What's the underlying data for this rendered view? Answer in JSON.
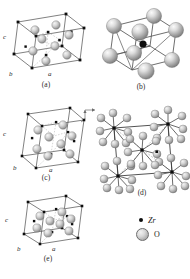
{
  "figure": {
    "type": "crystal-structure-diagram",
    "background": "#ffffff"
  },
  "panels": [
    {
      "id": "a",
      "caption": "(a)",
      "kind": "unit-cell",
      "axes": {
        "a": "a",
        "b": "b",
        "c": "c"
      },
      "note": "tilted monoclinic-like unit cell with small Zr dots and gray O spheres"
    },
    {
      "id": "b",
      "caption": "(b)",
      "kind": "coordination-cube",
      "note": "cube with eight large gray O spheres at corners and one black Zr atom near centre"
    },
    {
      "id": "c",
      "caption": "(c)",
      "kind": "unit-cell",
      "axes": {
        "a": "a",
        "b": "b",
        "c": "c"
      },
      "note": "tetragonal-like unit cell, upright cube"
    },
    {
      "id": "d",
      "caption": "(d)",
      "kind": "polyhedral-network",
      "note": "projected network of ZrO8 coordination units linked in a square cell"
    },
    {
      "id": "e",
      "caption": "(e)",
      "kind": "unit-cell",
      "axes": {
        "a": "a",
        "b": "b",
        "c": "c"
      },
      "note": "flattened cubic unit cell"
    }
  ],
  "legend": {
    "items": [
      {
        "symbol": "zr-dot",
        "label": "Zr",
        "color": "#0d0d0d",
        "size": "small"
      },
      {
        "symbol": "o-sphere",
        "label": "O",
        "color": "#c6c6c6",
        "size": "large"
      }
    ]
  },
  "orientation_marker": {
    "name": "axis-tripod",
    "note": "small corner axis arrow marker between panels (c) and (d)"
  },
  "colors": {
    "line": "#4a4a4a",
    "zr": "#0d0d0d",
    "o_light": "#e8e8e8",
    "o_mid": "#bdbdbd",
    "o_dark": "#8a8a8a",
    "text": "#1a1a1a"
  }
}
